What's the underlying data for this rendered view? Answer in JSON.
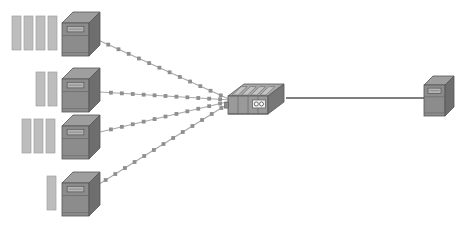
{
  "diagram": {
    "type": "network-topology",
    "background_color": "#ffffff",
    "canvas": {
      "width": 474,
      "height": 229
    },
    "palette": {
      "server_body": "#8c8c8c",
      "server_top": "#9e9e9e",
      "server_side": "#6e6e6e",
      "server_outline": "#555555",
      "server_front_panel": "#b4b4b4",
      "disk_bar_fill": "#bdbdbd",
      "disk_bar_outline": "#a0a0a0",
      "switch_body": "#9a9a9a",
      "switch_top": "#a8a8a8",
      "switch_side": "#777777",
      "switch_port": "#c4c4c4",
      "link_dashed": "#a8a8a8",
      "link_solid": "#555555",
      "bead": "#8f8f8f"
    },
    "nodes": [
      {
        "id": "server-1",
        "name": "left-server-1",
        "kind": "server-tower",
        "x": 62,
        "y": 12,
        "width": 38,
        "height": 44,
        "disk_bars": 4,
        "disk_bars_x": 12,
        "disk_bars_y": 16,
        "disk_bar_width": 9,
        "disk_bar_height": 34,
        "disk_bar_gap": 3
      },
      {
        "id": "server-2",
        "name": "left-server-2",
        "kind": "server-tower",
        "x": 62,
        "y": 68,
        "width": 38,
        "height": 44,
        "disk_bars": 2,
        "disk_bars_x": 36,
        "disk_bars_y": 72,
        "disk_bar_width": 9,
        "disk_bar_height": 34,
        "disk_bar_gap": 3
      },
      {
        "id": "server-3",
        "name": "left-server-3",
        "kind": "server-tower",
        "x": 62,
        "y": 115,
        "width": 38,
        "height": 44,
        "disk_bars": 3,
        "disk_bars_x": 22,
        "disk_bars_y": 119,
        "disk_bar_width": 9,
        "disk_bar_height": 34,
        "disk_bar_gap": 3
      },
      {
        "id": "server-4",
        "name": "left-server-4",
        "kind": "server-tower",
        "x": 62,
        "y": 172,
        "width": 38,
        "height": 44,
        "disk_bars": 1,
        "disk_bars_x": 47,
        "disk_bars_y": 176,
        "disk_bar_width": 9,
        "disk_bar_height": 34,
        "disk_bar_gap": 3
      },
      {
        "id": "switch-central",
        "name": "central-network-switch",
        "kind": "network-switch",
        "x": 228,
        "y": 84,
        "width": 56,
        "height": 30,
        "ports": 4,
        "led_pairs": 2
      },
      {
        "id": "server-right",
        "name": "right-server",
        "kind": "server-tower",
        "x": 424,
        "y": 76,
        "width": 30,
        "height": 40,
        "disk_bars": 0
      }
    ],
    "links": [
      {
        "id": "link-1",
        "name": "link-server1-to-switch",
        "from": "server-1",
        "to": "switch-central",
        "style": "beaded-dashed",
        "x1": 98,
        "y1": 40,
        "x2": 231,
        "y2": 100
      },
      {
        "id": "link-2",
        "name": "link-server2-to-switch",
        "from": "server-2",
        "to": "switch-central",
        "style": "beaded-dashed",
        "x1": 100,
        "y1": 92,
        "x2": 231,
        "y2": 100
      },
      {
        "id": "link-3",
        "name": "link-server3-to-switch",
        "from": "server-3",
        "to": "switch-central",
        "style": "beaded-dashed",
        "x1": 100,
        "y1": 132,
        "x2": 231,
        "y2": 101
      },
      {
        "id": "link-4",
        "name": "link-server4-to-switch",
        "from": "server-4",
        "to": "switch-central",
        "style": "beaded-dashed",
        "x1": 96,
        "y1": 186,
        "x2": 231,
        "y2": 102
      },
      {
        "id": "link-5",
        "name": "link-switch-to-right-server",
        "from": "switch-central",
        "to": "server-right",
        "style": "solid",
        "x1": 286,
        "y1": 98,
        "x2": 426,
        "y2": 98
      }
    ]
  }
}
